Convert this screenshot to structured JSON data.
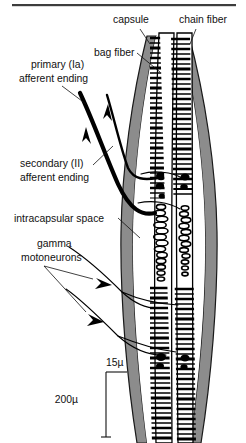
{
  "figure": {
    "background_color": "#ffffff"
  },
  "top_rule": {
    "name": "horizontal-divider-rule",
    "color": "#3d3d3d"
  },
  "labels": [
    {
      "id": "capsule",
      "text": "capsule",
      "x": 113,
      "y": 23,
      "anchor": "start"
    },
    {
      "id": "chain_fiber",
      "text": "chain fiber",
      "x": 179,
      "y": 23,
      "anchor": "start"
    },
    {
      "id": "bag_fiber",
      "text": "bag fiber",
      "x": 94,
      "y": 56,
      "anchor": "start"
    },
    {
      "id": "primary_afferent_line1",
      "text": "primary (Ia)",
      "x": 31,
      "y": 68,
      "anchor": "start"
    },
    {
      "id": "primary_afferent_line2",
      "text": "afferent ending",
      "x": 19,
      "y": 82,
      "anchor": "start"
    },
    {
      "id": "secondary_afferent_line1",
      "text": "secondary (II)",
      "x": 20,
      "y": 167,
      "anchor": "start"
    },
    {
      "id": "secondary_afferent_line2",
      "text": "afferent ending",
      "x": 20,
      "y": 181,
      "anchor": "start"
    },
    {
      "id": "intracapsular_space",
      "text": "intracapsular space",
      "x": 14,
      "y": 222,
      "anchor": "start"
    },
    {
      "id": "gamma_line1",
      "text": "gamma",
      "x": 37,
      "y": 247,
      "anchor": "start"
    },
    {
      "id": "gamma_line2",
      "text": "motoneurons",
      "x": 21,
      "y": 261,
      "anchor": "start"
    }
  ],
  "scale_bars": [
    {
      "id": "horizontal-scale",
      "value": "15µ",
      "label_x": 106,
      "label_y": 365,
      "orientation": "horizontal"
    },
    {
      "id": "vertical-scale",
      "value": "200µ",
      "label_x": 78,
      "label_y": 399,
      "orientation": "vertical"
    }
  ],
  "anatomy": {
    "capsule_color": "#8c8c8c",
    "capsule_outline_color": "#1a1a1a",
    "fiber_fill_color": "#ffffff",
    "fiber_outline_color": "#000000",
    "nerve_color": "#000000",
    "parts": [
      "capsule",
      "bag fiber",
      "chain fiber",
      "intracapsular space",
      "primary (Ia) afferent ending",
      "secondary (II) afferent ending",
      "gamma motoneurons"
    ]
  },
  "flow_arrows": [
    {
      "id": "afferent-arrow-upper",
      "direction": "up"
    },
    {
      "id": "afferent-arrow-lower",
      "direction": "up"
    },
    {
      "id": "gamma-arrow-upper",
      "direction": "down-right"
    },
    {
      "id": "gamma-arrow-lower",
      "direction": "down-right"
    }
  ]
}
